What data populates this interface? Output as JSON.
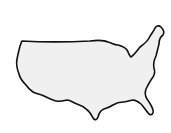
{
  "map": {
    "subject": "Outline map of the contiguous United States",
    "fill_color": "#f0f0f0",
    "stroke_color": "#111111",
    "background_color": "#ffffff"
  }
}
